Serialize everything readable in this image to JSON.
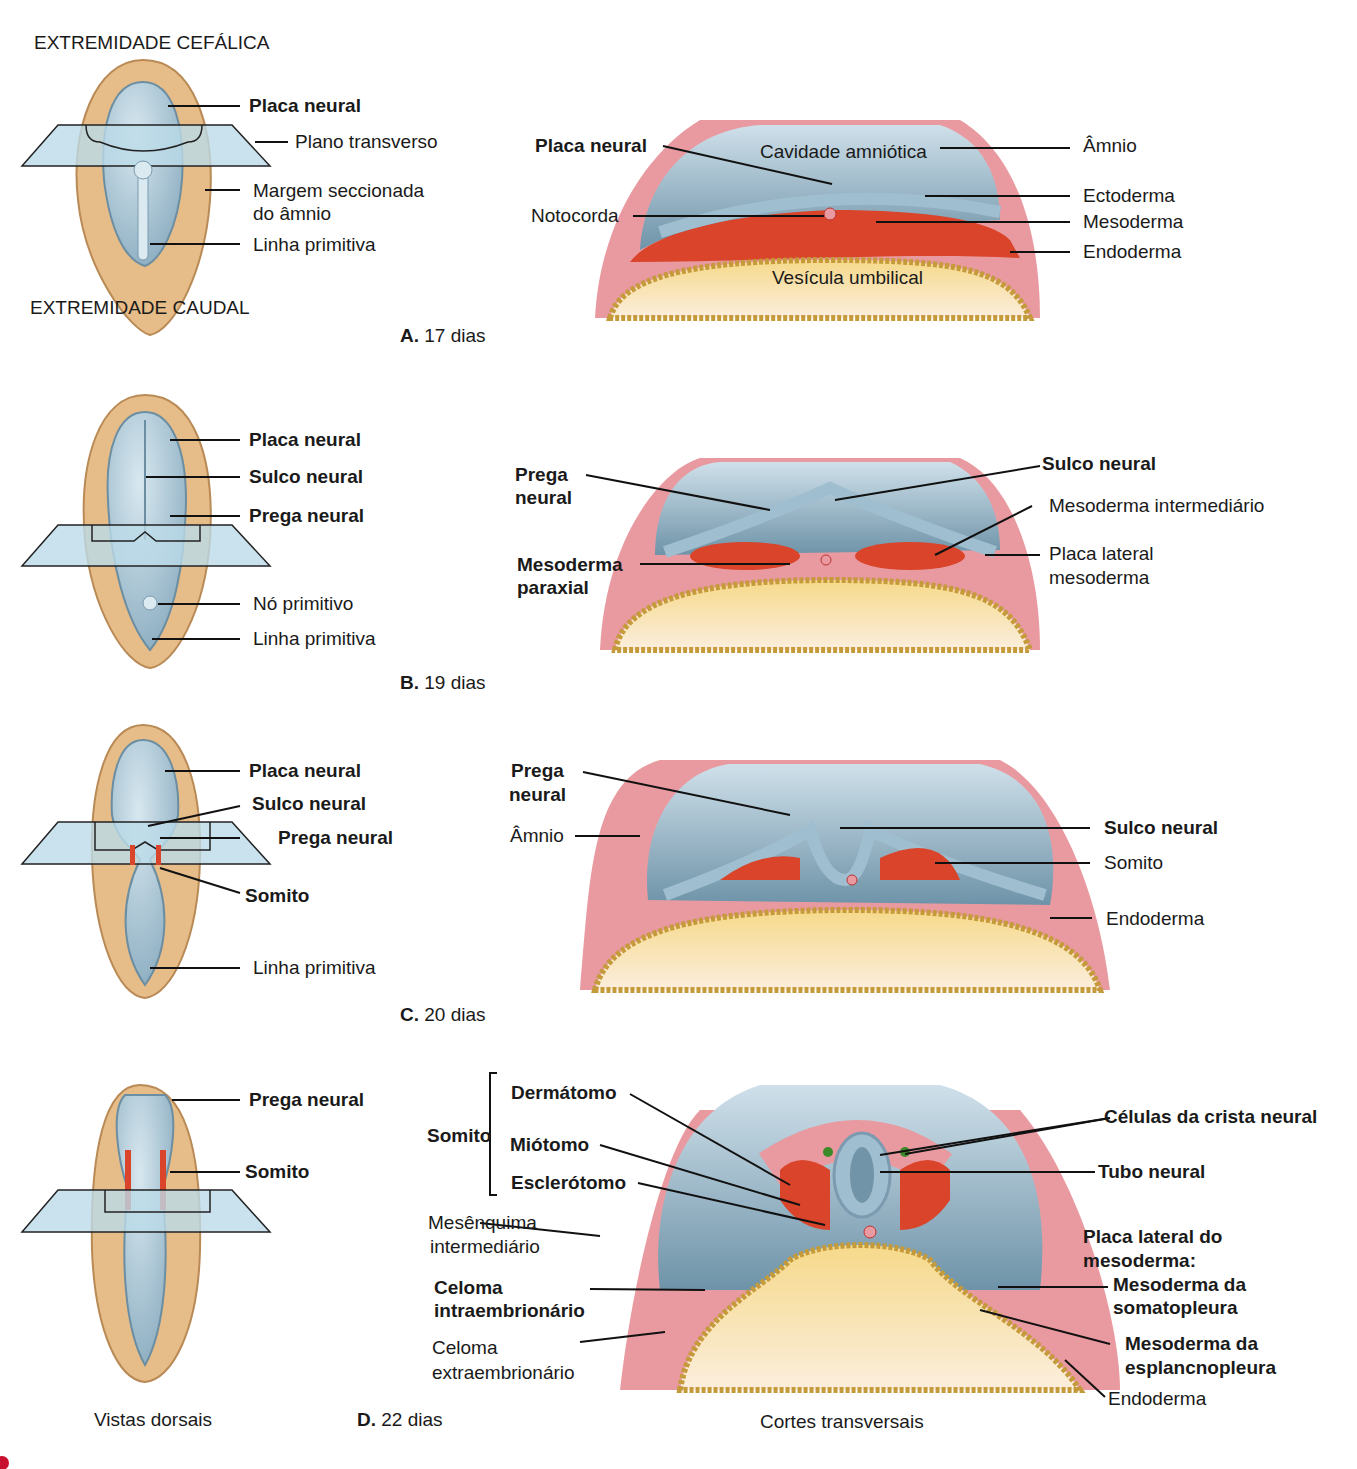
{
  "panels": [
    {
      "id": "A",
      "caption_letter": "A.",
      "caption_text": "17 dias",
      "dorsal_top": "EXTREMIDADE CEFÁLICA",
      "dorsal_bottom": "EXTREMIDADE CAUDAL",
      "dorsal_labels": [
        "Placa neural",
        "Plano transverso",
        "Margem seccionada",
        "do âmnio",
        "Linha primitiva"
      ],
      "section_labels": [
        "Placa neural",
        "Cavidade amniótica",
        "Âmnio",
        "Ectoderma",
        "Notocorda",
        "Mesoderma",
        "Endoderma",
        "Vesícula umbilical"
      ]
    },
    {
      "id": "B",
      "caption_letter": "B.",
      "caption_text": "19 dias",
      "dorsal_labels": [
        "Placa neural",
        "Sulco neural",
        "Prega neural",
        "Nó primitivo",
        "Linha primitiva"
      ],
      "section_labels": [
        "Prega",
        "neural",
        "Sulco neural",
        "Mesoderma intermediário",
        "Mesoderma",
        "paraxial",
        "Placa lateral",
        "mesoderma"
      ]
    },
    {
      "id": "C",
      "caption_letter": "C.",
      "caption_text": "20 dias",
      "dorsal_labels": [
        "Placa neural",
        "Sulco neural",
        "Prega neural",
        "Somito",
        "Linha primitiva"
      ],
      "section_labels": [
        "Prega",
        "neural",
        "Âmnio",
        "Sulco neural",
        "Somito",
        "Endoderma"
      ]
    },
    {
      "id": "D",
      "caption_letter": "D.",
      "caption_text": "22 dias",
      "dorsal_labels": [
        "Prega neural",
        "Somito"
      ],
      "section_labels": [
        "Somito",
        "Dermátomo",
        "Miótomo",
        "Esclerótomo",
        "Mesênquima",
        "intermediário",
        "Celoma",
        "intraembrionário",
        "Celoma",
        "extraembrionário",
        "Células da crista neural",
        "Tubo neural",
        "Placa lateral do",
        "mesoderma:",
        "Mesoderma da",
        "somatopleura",
        "Mesoderma da",
        "esplancnopleura",
        "Endoderma"
      ]
    }
  ],
  "footer": {
    "left": "Vistas dorsais",
    "right": "Cortes transversais"
  },
  "colors": {
    "neural_blue": "#8fb3c6",
    "amnion_tan": "#e2b67e",
    "mesoderm_red": "#d9442a",
    "pink": "#e99aa0",
    "yolk": "#f6c766",
    "plane": "#bcdbe8"
  }
}
